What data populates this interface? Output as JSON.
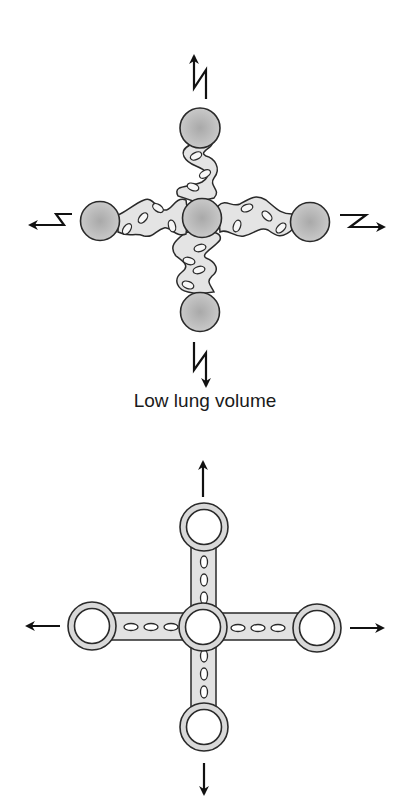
{
  "figure": {
    "panels": [
      {
        "id": "low-volume",
        "caption": "Low lung volume",
        "description": "Five filled gray airway/vessel nodes connected by wavy, folded interstitial tissue; zigzag (recoil) arrows pointing outward in four directions"
      },
      {
        "id": "high-volume",
        "caption": "",
        "description": "Five open ring nodes connected by straight, stretched tissue bars; straight traction arrows pointing outward in four directions"
      }
    ],
    "colors": {
      "stroke": "#2a2a2a",
      "node_fill": "#b5b5b5",
      "node_fill_light": "#d2d2d2",
      "tissue_fill": "#e4e4e4",
      "ring_fill": "#d9d9d9",
      "background": "#ffffff"
    }
  }
}
